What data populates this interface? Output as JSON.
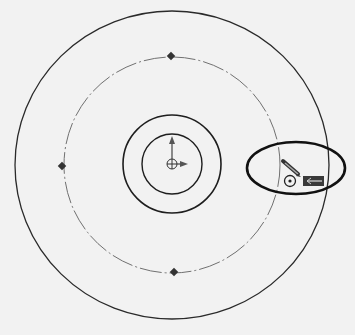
{
  "diagram": {
    "title": "Sketch concentric circles with construction circle",
    "background": "#f2f2f2",
    "line_color": "#2a2a2a",
    "construction_color": "#6a6a6a",
    "center": {
      "x": 172,
      "y": 165
    },
    "circles": [
      {
        "name": "outer-circle",
        "r": 156,
        "style": "solid"
      },
      {
        "name": "construction-circle",
        "r": 108,
        "style": "dash-dot"
      },
      {
        "name": "middle-circle",
        "r": 48,
        "style": "solid"
      },
      {
        "name": "inner-circle",
        "r": 29,
        "style": "solid"
      }
    ],
    "quadrant_points": [
      "top",
      "left",
      "bottom"
    ],
    "cursor": {
      "tool": "sketch-pencil",
      "icon": "pencil-icon",
      "snap": "concentric-snap-icon",
      "badge": "construction-line-badge"
    },
    "highlight_ellipse": {
      "cx": 296,
      "cy": 168,
      "rx": 50,
      "ry": 25
    }
  }
}
